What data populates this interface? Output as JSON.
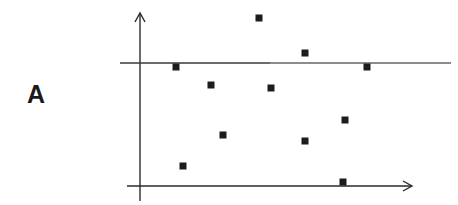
{
  "panel": {
    "label": "A"
  },
  "colors": {
    "axis": "#2a2a2a",
    "marker": "#1c1c1c",
    "reference_line_dark": "#3a3a3a",
    "reference_line_light": "#8c8c8c"
  },
  "chart_data": {
    "type": "scatter",
    "title": "",
    "xlabel": "",
    "ylabel": "",
    "panel_label": "A",
    "grid": false,
    "legend": null,
    "axes": {
      "ticks": "none",
      "arrows": true
    },
    "reference_line": {
      "orientation": "horizontal",
      "y": 0.78,
      "note": "horizontal reference line across plot"
    },
    "xlim": [
      0,
      1
    ],
    "ylim": [
      0,
      1
    ],
    "points": [
      {
        "x": 0.13,
        "y": 0.76
      },
      {
        "x": 0.44,
        "y": 1.0
      },
      {
        "x": 0.61,
        "y": 0.82
      },
      {
        "x": 0.84,
        "y": 0.76
      },
      {
        "x": 0.26,
        "y": 0.6
      },
      {
        "x": 0.49,
        "y": 0.59
      },
      {
        "x": 0.76,
        "y": 0.39
      },
      {
        "x": 0.31,
        "y": 0.31
      },
      {
        "x": 0.61,
        "y": 0.27
      },
      {
        "x": 0.16,
        "y": 0.12
      },
      {
        "x": 0.75,
        "y": 0.03
      }
    ],
    "pixel_points": [
      [
        176,
        67
      ],
      [
        259,
        18
      ],
      [
        305,
        53
      ],
      [
        367,
        67
      ],
      [
        211,
        85
      ],
      [
        271,
        88
      ],
      [
        345,
        120
      ],
      [
        223,
        135
      ],
      [
        305,
        141
      ],
      [
        183,
        166
      ],
      [
        343,
        182
      ]
    ]
  }
}
